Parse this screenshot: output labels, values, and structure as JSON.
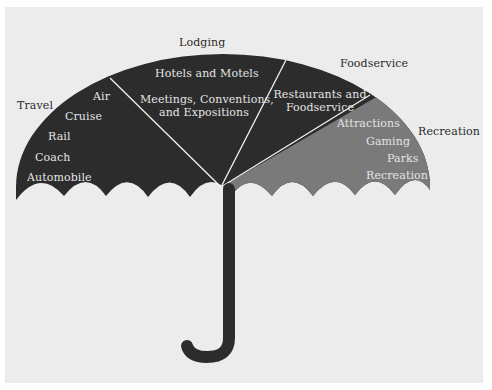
{
  "diagram": {
    "type": "umbrella",
    "colors": {
      "background_outer": "#ffffff",
      "panel": "#ececec",
      "dark_segment": "#2c2c2c",
      "recreation_segment": "#7a7a7a",
      "divider": "#f2f2f2",
      "external_label": "#2a2a2a",
      "internal_label": "#e4e4e4"
    },
    "segments": [
      {
        "category": "Travel",
        "items": [
          "Air",
          "Cruise",
          "Rail",
          "Coach",
          "Automobile"
        ]
      },
      {
        "category": "Lodging",
        "items": [
          "Hotels and Motels",
          "Meetings, Conventions,",
          "and Expositions"
        ]
      },
      {
        "category": "Foodservice",
        "items": [
          "Restaurants and",
          "Foodservice"
        ]
      },
      {
        "category": "Recreation",
        "items": [
          "Attractions",
          "Gaming",
          "Parks",
          "Recreation"
        ]
      }
    ]
  }
}
